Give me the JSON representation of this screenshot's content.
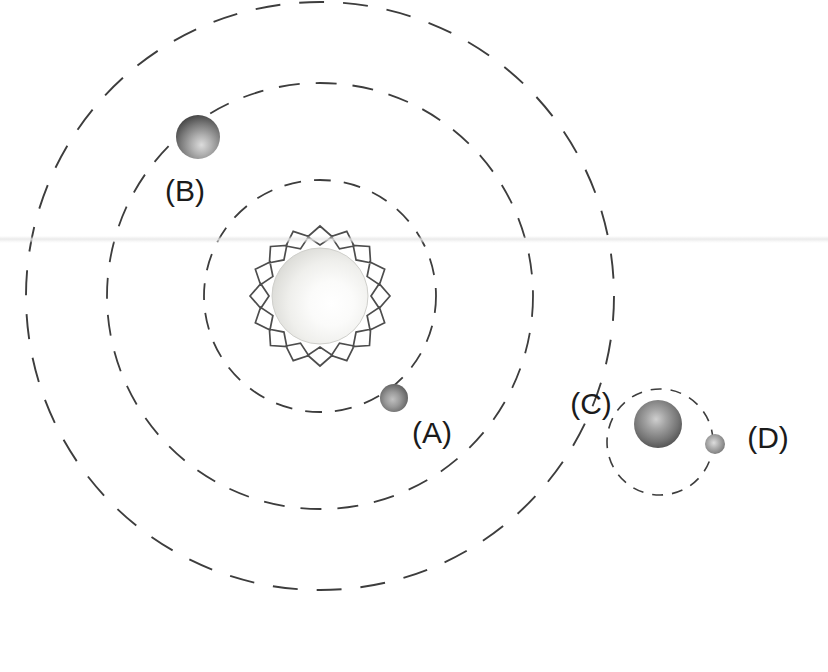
{
  "figure": {
    "kind": "solar-system-orbit-diagram",
    "background_color": "#ffffff",
    "width": 828,
    "height": 672
  },
  "star": {
    "name": "sun",
    "center_x": 320,
    "center_y": 296,
    "disk_radius": 48,
    "corona_outer_radius": 70,
    "corona_points": 16,
    "disk_fill_light": "#ffffff",
    "disk_fill_mid": "#f1f1ef",
    "disk_fill_edge": "#c9c9c5",
    "corona_stroke": "#4d4d4d",
    "corona_stroke_width": 1.7,
    "highlight_offset_x": 0.62,
    "highlight_offset_y": 0.58
  },
  "orbits": [
    {
      "id": "orbit-inner",
      "label_for": "A",
      "center_x": 320,
      "center_y": 296,
      "radius": 116,
      "stroke": "#3d3d3d",
      "stroke_width": 1.8,
      "dash": "17 13"
    },
    {
      "id": "orbit-middle",
      "label_for": "B",
      "center_x": 320,
      "center_y": 296,
      "radius": 213,
      "stroke": "#3d3d3d",
      "stroke_width": 1.8,
      "dash": "21 16"
    },
    {
      "id": "orbit-outer",
      "label_for": "C",
      "center_x": 320,
      "center_y": 296,
      "radius": 294,
      "stroke": "#3d3d3d",
      "stroke_width": 1.9,
      "dash": "25 19"
    }
  ],
  "moon_orbit": {
    "id": "orbit-moon",
    "label_for": "D",
    "center_x": 660,
    "center_y": 442,
    "radius": 53,
    "stroke": "#3d3d3d",
    "stroke_width": 1.6,
    "dash": "11 9"
  },
  "bodies": [
    {
      "id": "planet-a",
      "label": "(A)",
      "center_x": 394,
      "center_y": 398,
      "radius": 14,
      "fill_light": "#b9b9b9",
      "fill_mid": "#7c7c7c",
      "fill_dark": "#3c3c3c",
      "highlight_offset_x": 0.45,
      "highlight_offset_y": 0.55,
      "label_x": 432,
      "label_y": 435
    },
    {
      "id": "planet-b",
      "label": "(B)",
      "center_x": 198,
      "center_y": 137,
      "radius": 22,
      "fill_light": "#d2d2d2",
      "fill_mid": "#8a8a8a",
      "fill_dark": "#303030",
      "highlight_offset_x": 0.55,
      "highlight_offset_y": 0.65,
      "label_x": 185,
      "label_y": 193
    },
    {
      "id": "planet-c",
      "label": "(C)",
      "center_x": 658,
      "center_y": 424,
      "radius": 24,
      "fill_light": "#c6c6c6",
      "fill_mid": "#7b7b7b",
      "fill_dark": "#2e2e2e",
      "highlight_offset_x": 0.48,
      "highlight_offset_y": 0.42,
      "label_x": 591,
      "label_y": 406
    },
    {
      "id": "moon-d",
      "label": "(D)",
      "center_x": 715,
      "center_y": 444,
      "radius": 10,
      "fill_light": "#d5d5d5",
      "fill_mid": "#8f8f8f",
      "fill_dark": "#4a4a4a",
      "highlight_offset_x": 0.45,
      "highlight_offset_y": 0.45,
      "label_x": 768,
      "label_y": 440
    }
  ],
  "labels": {
    "a": "(A)",
    "b": "(B)",
    "c": "(C)",
    "d": "(D)"
  },
  "artifacts": {
    "scan_band_y": 236
  }
}
